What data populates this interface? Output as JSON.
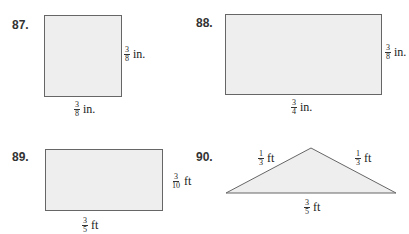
{
  "problems": [
    {
      "number": "87.",
      "shape": "square",
      "side_label": {
        "numerator": "3",
        "denominator": "8",
        "unit": "in."
      },
      "bottom_label": {
        "numerator": "3",
        "denominator": "8",
        "unit": "in."
      }
    },
    {
      "number": "88.",
      "shape": "rectangle",
      "side_label": {
        "numerator": "3",
        "denominator": "8",
        "unit": "in."
      },
      "bottom_label": {
        "numerator": "3",
        "denominator": "4",
        "unit": "in."
      }
    },
    {
      "number": "89.",
      "shape": "rectangle",
      "side_label": {
        "numerator": "3",
        "denominator": "10",
        "unit": "ft"
      },
      "bottom_label": {
        "numerator": "3",
        "denominator": "5",
        "unit": "ft"
      }
    },
    {
      "number": "90.",
      "shape": "triangle",
      "left_label": {
        "numerator": "1",
        "denominator": "3",
        "unit": "ft"
      },
      "right_label": {
        "numerator": "1",
        "denominator": "3",
        "unit": "ft"
      },
      "bottom_label": {
        "numerator": "3",
        "denominator": "5",
        "unit": "ft"
      }
    }
  ],
  "colors": {
    "fill": "#eeeeee",
    "stroke": "#666666"
  }
}
